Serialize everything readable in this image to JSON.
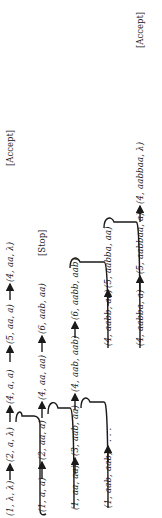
{
  "diagram": {
    "type": "computation-tree",
    "rows": [
      {
        "nodes": [
          "(1, λ, λ)",
          "(2, a, λ)",
          "(4, a, a)",
          "(5, aa, a)",
          "(4, aa, λ)"
        ],
        "result": "[Accept]"
      },
      {
        "nodes": [
          "(1, a, a)",
          "(2, aa, a)",
          "(4, aa, aa)",
          "(6, aab, aa)"
        ],
        "result": "[Stop]"
      },
      {
        "nodes": [
          "(1, aa, aa)",
          "(3, aab, aa)",
          "(4, aab, aab)",
          "(6, aabb, aab)"
        ],
        "result": ""
      },
      {
        "nodes": [
          "(1, aab, aab)",
          ". . .",
          "(4, aabb, aa)",
          "(5, aabba, aa)"
        ],
        "result": ""
      },
      {
        "nodes": [
          "(4, aabba, a)",
          "(5, aabbaa, a)",
          "(4, aabbaa, λ)"
        ],
        "result": "[Accept]"
      }
    ]
  }
}
